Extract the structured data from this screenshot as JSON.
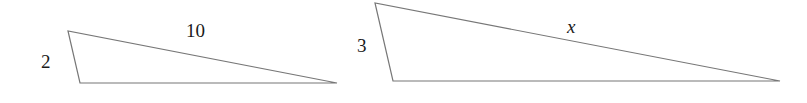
{
  "figure": {
    "background_color": "#ffffff",
    "stroke_color": "#777777",
    "text_color": "#1a1a1a",
    "stroke_width": 1.2,
    "width": 807,
    "height": 103
  },
  "shapes": [
    {
      "name": "left-triangle",
      "points": "68,31 80,83 337,83",
      "vertices": {
        "apex": [
          68,
          31
        ],
        "bottom_left": [
          80,
          83
        ],
        "right_tip": [
          337,
          83
        ]
      }
    },
    {
      "name": "right-triangle",
      "points": "375,3 393,81 780,81",
      "vertices": {
        "apex": [
          375,
          3
        ],
        "bottom_left": [
          393,
          81
        ],
        "right_tip": [
          780,
          81
        ]
      }
    }
  ],
  "labels": {
    "left_short_side": "2",
    "left_hypotenuse": "10",
    "right_short_side": "3",
    "right_hypotenuse": "x"
  }
}
